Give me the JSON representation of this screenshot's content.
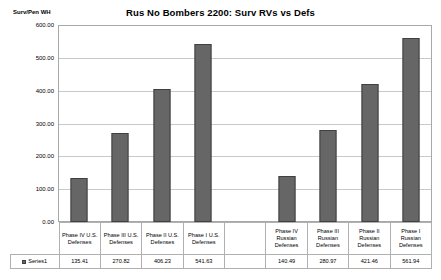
{
  "chart_data": {
    "type": "bar",
    "title": "Rus No Bombers 2200: Surv RVs vs Defs",
    "ylabel": "Surv/Pen WH",
    "xlabel": "",
    "ylim": [
      0,
      600
    ],
    "ytick_step": 100,
    "ytick_labels": [
      "600.00",
      "500.00",
      "400.00",
      "300.00",
      "200.00",
      "100.00",
      "0.00"
    ],
    "ytick_values": [
      600,
      500,
      400,
      300,
      200,
      100,
      0
    ],
    "grid": true,
    "legend_position": "data-table",
    "categories": [
      "Phase IV U.S. Defenses",
      "Phase III U.S. Defenses",
      "Phase II U.S. Defenses",
      "Phase I U.S. Defenses",
      "",
      "Phase IV Russian Defenses",
      "Phase III Russian Defenses",
      "Phase II Russian Defenses",
      "Phase I Russian Defenses"
    ],
    "category_lines": [
      [
        "Phase IV U.S.",
        "Defenses"
      ],
      [
        "Phase III U.S.",
        "Defenses"
      ],
      [
        "Phase II U.S.",
        "Defenses"
      ],
      [
        "Phase I U.S.",
        "Defenses"
      ],
      [
        ""
      ],
      [
        "Phase IV",
        "Russian",
        "Defenses"
      ],
      [
        "Phase III",
        "Russian",
        "Defenses"
      ],
      [
        "Phase II",
        "Russian",
        "Defenses"
      ],
      [
        "Phase I",
        "Russian",
        "Defenses"
      ]
    ],
    "series": [
      {
        "name": "Series1",
        "color": "#666666",
        "values": [
          135.41,
          270.82,
          406.23,
          541.63,
          null,
          140.49,
          280.97,
          421.46,
          561.94
        ],
        "value_labels": [
          "135.41",
          "270.82",
          "406.23",
          "541.63",
          "",
          "140.49",
          "280.97",
          "421.46",
          "561.94"
        ]
      }
    ]
  }
}
